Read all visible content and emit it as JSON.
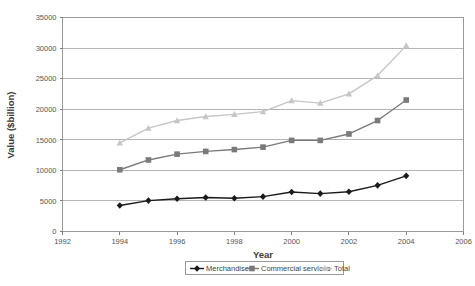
{
  "chart_data": {
    "type": "line",
    "title": "",
    "xlabel": "Year",
    "ylabel": "Value ($billion)",
    "xlim": [
      1992,
      2006
    ],
    "ylim": [
      0,
      35000
    ],
    "xticks": [
      1992,
      1994,
      1996,
      1998,
      2000,
      2002,
      2004,
      2006
    ],
    "yticks": [
      0,
      5000,
      10000,
      15000,
      20000,
      25000,
      30000,
      35000
    ],
    "xtick_labels": [
      "1992",
      "1994",
      "1996",
      "1998",
      "2000",
      "2002",
      "2004",
      "2006"
    ],
    "ytick_labels": [
      "0",
      "5000",
      "10000",
      "15000",
      "20000",
      "25000",
      "30000",
      "35000"
    ],
    "grid": "horizontal",
    "legend_position": "bottom",
    "x": [
      1994,
      1995,
      1996,
      1997,
      1998,
      1999,
      2000,
      2001,
      2002,
      2003,
      2004
    ],
    "series": [
      {
        "name": "Merchandise",
        "color": "#1a1a1a",
        "marker": "diamond",
        "values": [
          4250,
          5050,
          5350,
          5550,
          5450,
          5700,
          6450,
          6200,
          6500,
          7550,
          9100
        ]
      },
      {
        "name": "Commercial services",
        "color": "#7a7a7a",
        "marker": "square",
        "values": [
          10100,
          11700,
          12650,
          13100,
          13400,
          13800,
          14900,
          14900,
          15950,
          18150,
          21500
        ]
      },
      {
        "name": "Total",
        "color": "#c6c6c6",
        "marker": "triangle",
        "values": [
          14500,
          16900,
          18150,
          18800,
          19150,
          19600,
          21400,
          21000,
          22500,
          25500,
          30400
        ]
      }
    ]
  },
  "legend": {
    "items": [
      {
        "label": "Merchandise"
      },
      {
        "label": "Commercial services"
      },
      {
        "label": "Total"
      }
    ]
  },
  "axes": {
    "x_title": "Year",
    "y_title": "Value ($billion)"
  }
}
